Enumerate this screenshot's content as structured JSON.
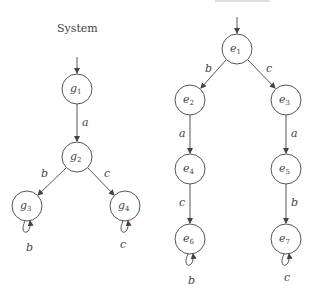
{
  "left_panel": {
    "title": "System",
    "nodes": [
      {
        "id": "g1",
        "base": "g",
        "sub": "1",
        "x": 77,
        "y": 89
      },
      {
        "id": "g2",
        "base": "g",
        "sub": "2",
        "x": 77,
        "y": 157
      },
      {
        "id": "g3",
        "base": "g",
        "sub": "3",
        "x": 27,
        "y": 206
      },
      {
        "id": "g4",
        "base": "g",
        "sub": "4",
        "x": 125,
        "y": 206
      }
    ],
    "edges": [
      {
        "from": "g1",
        "to": "g2",
        "label": "a"
      },
      {
        "from": "g2",
        "to": "g3",
        "label": "b"
      },
      {
        "from": "g2",
        "to": "g4",
        "label": "c"
      },
      {
        "from": "g3",
        "to": "g3",
        "label": "b"
      },
      {
        "from": "g4",
        "to": "g4",
        "label": "c"
      }
    ],
    "initial": "g1"
  },
  "right_panel": {
    "nodes": [
      {
        "id": "e1",
        "base": "e",
        "sub": "1",
        "x": 237,
        "y": 49
      },
      {
        "id": "e2",
        "base": "e",
        "sub": "2",
        "x": 190,
        "y": 100
      },
      {
        "id": "e3",
        "base": "e",
        "sub": "3",
        "x": 286,
        "y": 100
      },
      {
        "id": "e4",
        "base": "e",
        "sub": "4",
        "x": 190,
        "y": 169
      },
      {
        "id": "e5",
        "base": "e",
        "sub": "5",
        "x": 286,
        "y": 169
      },
      {
        "id": "e6",
        "base": "e",
        "sub": "6",
        "x": 190,
        "y": 239
      },
      {
        "id": "e7",
        "base": "e",
        "sub": "7",
        "x": 286,
        "y": 239
      }
    ],
    "edges": [
      {
        "from": "e1",
        "to": "e2",
        "label": "b"
      },
      {
        "from": "e1",
        "to": "e3",
        "label": "c"
      },
      {
        "from": "e2",
        "to": "e4",
        "label": "a"
      },
      {
        "from": "e3",
        "to": "e5",
        "label": "a"
      },
      {
        "from": "e4",
        "to": "e6",
        "label": "c"
      },
      {
        "from": "e5",
        "to": "e7",
        "label": "b"
      },
      {
        "from": "e6",
        "to": "e6",
        "label": "b"
      },
      {
        "from": "e7",
        "to": "e7",
        "label": "c"
      }
    ],
    "initial": "e1"
  },
  "style": {
    "stroke": "#555555",
    "text": "#444444",
    "background": "#ffffff"
  }
}
